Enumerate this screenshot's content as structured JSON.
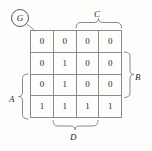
{
  "figure": {
    "type": "karnaugh-map",
    "output_label": "G",
    "rows": 4,
    "columns": 4
  },
  "kmap": {
    "cells": [
      [
        "0",
        "0",
        "0",
        "0"
      ],
      [
        "0",
        "1",
        "0",
        "0"
      ],
      [
        "0",
        "1",
        "0",
        "0"
      ],
      [
        "1",
        "1",
        "1",
        "1"
      ]
    ]
  },
  "groups": {
    "top": {
      "label": "C",
      "spans_columns": "3-4"
    },
    "right": {
      "label": "B",
      "spans_rows": "2-3"
    },
    "left": {
      "label": "A",
      "spans_rows": "3-4"
    },
    "bottom": {
      "label": "D",
      "spans_columns": "2-3"
    }
  }
}
